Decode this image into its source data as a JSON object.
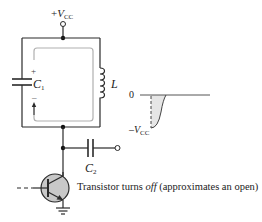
{
  "diagram": {
    "type": "circuit",
    "supply": {
      "prefix": "+",
      "symbol": "V",
      "subscript": "CC"
    },
    "components": {
      "c1": {
        "symbol": "C",
        "subscript": "1",
        "plus": "+",
        "minus": "–"
      },
      "inductor": {
        "symbol": "L"
      },
      "c2": {
        "symbol": "C",
        "subscript": "2"
      },
      "transistor": {
        "type": "npn-bjt"
      },
      "ground": {
        "type": "ground"
      }
    },
    "waveform": {
      "zero_label": "0",
      "neg_label": {
        "prefix": "–",
        "symbol": "V",
        "subscript": "CC"
      }
    },
    "annotation": {
      "before": "Transistor turns ",
      "emphasis": "off",
      "after": " (approximates an open)"
    },
    "colors": {
      "wire": "#2a2a2a",
      "current_loop": "#b0b0b0",
      "transistor_fill": "#c8c8c8",
      "waveform_fill": "#e6e6e6"
    }
  }
}
